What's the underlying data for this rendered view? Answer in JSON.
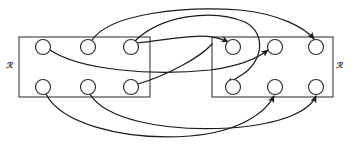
{
  "figure": {
    "type": "relation-mapping-diagram",
    "background_color": "#ffffff",
    "line_color": "#1a1a1a",
    "box_color": "#3a3a3a",
    "node_fill": "#ffffff",
    "width": 356,
    "height": 150
  },
  "sets": [
    {
      "id": "left-set",
      "label": "ℛ",
      "label_x": 9,
      "label_y": 68,
      "box": {
        "x": 19,
        "y": 37,
        "width": 131,
        "height": 60
      }
    },
    {
      "id": "right-set",
      "label": "ℛ",
      "label_x": 339,
      "label_y": 68,
      "box": {
        "x": 212,
        "y": 37,
        "width": 121,
        "height": 60
      }
    }
  ],
  "nodes": [
    {
      "id": "L1",
      "set": "left-set",
      "row": "top",
      "cx": 43,
      "cy": 47,
      "r": 7.5
    },
    {
      "id": "L2",
      "set": "left-set",
      "row": "top",
      "cx": 88,
      "cy": 47,
      "r": 7.5
    },
    {
      "id": "L3",
      "set": "left-set",
      "row": "top",
      "cx": 131,
      "cy": 47,
      "r": 7.5
    },
    {
      "id": "L4",
      "set": "left-set",
      "row": "bottom",
      "cx": 43,
      "cy": 87,
      "r": 7.5
    },
    {
      "id": "L5",
      "set": "left-set",
      "row": "bottom",
      "cx": 88,
      "cy": 87,
      "r": 7.5
    },
    {
      "id": "L6",
      "set": "left-set",
      "row": "bottom",
      "cx": 131,
      "cy": 87,
      "r": 7.5
    },
    {
      "id": "R1",
      "set": "right-set",
      "row": "top",
      "cx": 233,
      "cy": 47,
      "r": 7.5
    },
    {
      "id": "R2",
      "set": "right-set",
      "row": "top",
      "cx": 275,
      "cy": 47,
      "r": 7.5
    },
    {
      "id": "R3",
      "set": "right-set",
      "row": "top",
      "cx": 316,
      "cy": 47,
      "r": 7.5
    },
    {
      "id": "R4",
      "set": "right-set",
      "row": "bottom",
      "cx": 233,
      "cy": 87,
      "r": 7.5
    },
    {
      "id": "R5",
      "set": "right-set",
      "row": "bottom",
      "cx": 275,
      "cy": 87,
      "r": 7.5
    },
    {
      "id": "R6",
      "set": "right-set",
      "row": "bottom",
      "cx": 316,
      "cy": 87,
      "r": 7.5
    }
  ],
  "edges": [
    {
      "id": "edge-L1-R2",
      "from": "L1",
      "to": "R2",
      "arrow": true,
      "path": "M 50 50 C 80 70, 150 76, 210 70 C 240 66, 258 58, 268 50"
    },
    {
      "id": "edge-L2-R3",
      "from": "L2",
      "to": "R3",
      "arrow": true,
      "path": "M 92 40 C 110 14, 180 6, 240 10 C 280 14, 305 28, 314 39"
    },
    {
      "id": "edge-L3-R1",
      "from": "L3",
      "to": "R1",
      "arrow": true,
      "path": "M 135 41 C 160 16, 212 8, 245 22 C 268 34, 262 64, 240 76 C 234 80, 230 82, 227 84"
    },
    {
      "id": "edge-L3-R4",
      "from": "L3",
      "to": "R4",
      "arrow": true,
      "path": "M 137 43 C 170 40, 205 30, 228 42"
    },
    {
      "id": "edge-L4-R5",
      "from": "L4",
      "to": "R5",
      "arrow": true,
      "path": "M 46 94 C 60 122, 120 141, 190 136 C 240 132, 266 112, 274 96"
    },
    {
      "id": "edge-L5-R6",
      "from": "L5",
      "to": "R6",
      "arrow": true,
      "path": "M 90 94 C 104 118, 160 132, 230 128 C 285 124, 310 110, 316 96"
    },
    {
      "id": "edge-L6-R3",
      "from": "L6",
      "to": "R3",
      "arrow": false,
      "path": "M 138 84 C 165 76, 200 58, 212 44"
    }
  ]
}
